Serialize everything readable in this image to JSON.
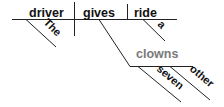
{
  "diagram": {
    "type": "Reed-Kellogg sentence diagram",
    "sentence_words": {
      "subject": "driver",
      "verb": "gives",
      "direct_object": "ride",
      "subject_modifier": "The",
      "object_modifier": "a",
      "indirect_object": "clowns",
      "indirect_object_modifiers": [
        "seven",
        "other"
      ]
    },
    "colors": {
      "line": "#222222",
      "text": "#111111",
      "indirect_object_text": "#7a7a7a"
    }
  }
}
